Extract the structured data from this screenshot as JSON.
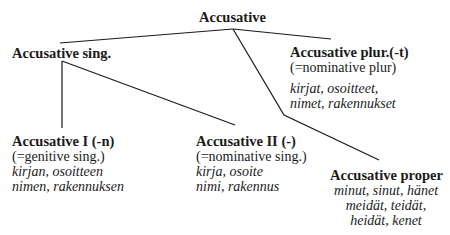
{
  "root": {
    "title": "Accusative"
  },
  "sing": {
    "title": "Accusative sing."
  },
  "plur": {
    "title": "Accusative plur.(-t)",
    "note": "(=nominative plur)",
    "examples": [
      "kirjat, osoitteet,",
      "nimet, rakennukset"
    ]
  },
  "acc1": {
    "title": "Accusative I (-n)",
    "note": "(=genitive sing.)",
    "examples": [
      "kirjan, osoitteen",
      "nimen, rakennuksen"
    ]
  },
  "acc2": {
    "title": "Accusative II (-)",
    "note": "(=nominative sing.)",
    "examples": [
      "kirja, osoite",
      "nimi, rakennus"
    ]
  },
  "proper": {
    "title": "Accusative proper",
    "examples": [
      "minut, sinut, hänet",
      "meidät, teidät,",
      "heidät, kenet"
    ]
  }
}
